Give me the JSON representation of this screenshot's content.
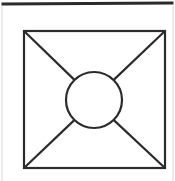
{
  "figure": {
    "canvas": {
      "width": 175,
      "height": 181,
      "background": "#ffffff"
    },
    "colors": {
      "ink": "#2b2b2b",
      "ink_light": "#9a9a9a",
      "page_edge": "#d8d8d8",
      "background": "#ffffff"
    },
    "page_border": {
      "label": "page-top-rule",
      "x1": 3,
      "y1": 4,
      "x2": 172,
      "y2": 3,
      "stroke": "#2b2b2b",
      "stroke_width": 3
    },
    "page_edges": [
      {
        "label": "page-left-edge",
        "x1": 2,
        "y1": 6,
        "x2": 2,
        "y2": 181,
        "stroke": "#d8d8d8",
        "stroke_width": 1
      },
      {
        "label": "page-right-edge",
        "x1": 173,
        "y1": 6,
        "x2": 173,
        "y2": 181,
        "stroke": "#d8d8d8",
        "stroke_width": 1
      }
    ],
    "square": {
      "label": "inner-square",
      "x": 24,
      "y": 31,
      "width": 141,
      "height": 137,
      "stroke": "#2b2b2b",
      "stroke_width": 2.2,
      "fill": "none",
      "corners": {
        "top_left": [
          24,
          31
        ],
        "top_right": [
          165,
          31
        ],
        "bottom_right": [
          165,
          168
        ],
        "bottom_left": [
          24,
          168
        ]
      }
    },
    "circle": {
      "label": "center-circle",
      "cx": 94,
      "cy": 100,
      "r": 28,
      "stroke": "#2b2b2b",
      "stroke_width": 2.2,
      "fill": "none"
    },
    "diagonals": [
      {
        "label": "diagonal-top-left-to-bottom-right",
        "from_corner": "top_left",
        "to_corner": "bottom_right",
        "segments": [
          {
            "x1": 24,
            "y1": 31,
            "x2": 82.7,
            "y2": 87.9
          },
          {
            "x1": 105.3,
            "y1": 112.1,
            "x2": 165,
            "y2": 168
          }
        ],
        "stroke": "#2b2b2b",
        "stroke_width": 2.2,
        "interrupted_by": "center-circle"
      },
      {
        "label": "diagonal-bottom-left-to-top-right",
        "from_corner": "bottom_left",
        "to_corner": "top_right",
        "segments": [
          {
            "x1": 24,
            "y1": 168,
            "x2": 82.7,
            "y2": 112.1
          },
          {
            "x1": 105.3,
            "y1": 87.9,
            "x2": 165,
            "y2": 31
          }
        ],
        "stroke": "#2b2b2b",
        "stroke_width": 2.2,
        "interrupted_by": "center-circle"
      }
    ]
  }
}
